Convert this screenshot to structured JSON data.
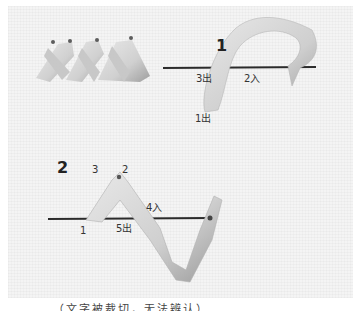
{
  "figure": {
    "panel1": {
      "step_number": "1",
      "labels": {
        "exit3": "3出",
        "enter2": "2入",
        "exit1": "1出"
      }
    },
    "panel2": {
      "step_number": "2",
      "labels": {
        "pt3": "3",
        "pt2": "2",
        "enter4": "4入",
        "pt1": "1",
        "exit5": "5出"
      }
    },
    "caption": "…（文字被裁切，无法辨认）…"
  },
  "colors": {
    "ribbon": "#d9d9d9",
    "ribbon_shadow": "#a8a8a8",
    "needle": "#2b2b2b",
    "fabric": "#f4f4f4"
  }
}
